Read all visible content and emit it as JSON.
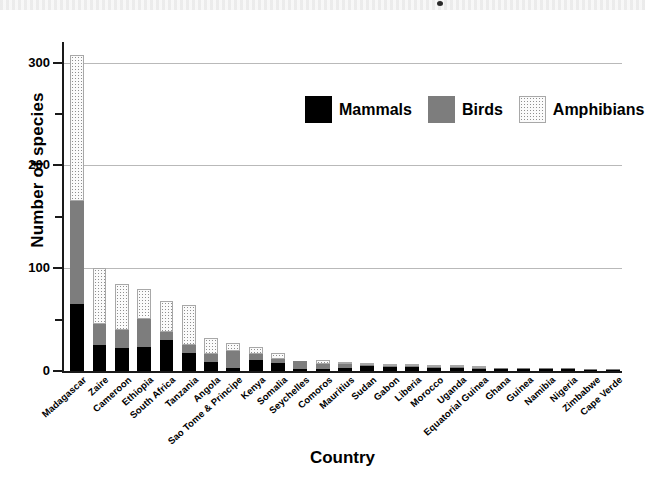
{
  "chart_data": {
    "type": "bar",
    "subtype": "stacked-bar",
    "title": "",
    "xlabel": "Country",
    "ylabel": "Number of species",
    "ylim": [
      0,
      320
    ],
    "ytick_labels": [
      "0",
      "100",
      "200",
      "300"
    ],
    "ytick_values": [
      0,
      100,
      200,
      300
    ],
    "yminor_ticks": [
      50,
      150,
      250
    ],
    "grid": "horizontal-major",
    "legend_position": "upper-center",
    "categories": [
      "Madagascar",
      "Zaire",
      "Cameroon",
      "Ethiopia",
      "South Africa",
      "Tanzania",
      "Angola",
      "Sao Tome & Principe",
      "Kenya",
      "Somalia",
      "Seychelles",
      "Comoros",
      "Mauritius",
      "Sudan",
      "Gabon",
      "Liberia",
      "Morocco",
      "Uganda",
      "Equatorial Guinea",
      "Ghana",
      "Guinea",
      "Namibia",
      "Nigeria",
      "Zimbabwe",
      "Cape Verde"
    ],
    "series": [
      {
        "name": "Mammals",
        "color": "#000000",
        "values": [
          65,
          25,
          22,
          23,
          30,
          18,
          9,
          3,
          11,
          8,
          2,
          2,
          3,
          5,
          4,
          4,
          3,
          3,
          2,
          2,
          2,
          2,
          2,
          1,
          1
        ]
      },
      {
        "name": "Birds",
        "color": "#7d7d7d",
        "values": [
          100,
          21,
          18,
          28,
          8,
          7,
          8,
          16,
          6,
          4,
          8,
          5,
          4,
          1,
          1,
          1,
          1,
          1,
          1,
          1,
          1,
          1,
          1,
          1,
          1
        ]
      },
      {
        "name": "Amphibians",
        "color": "#f2f2f2",
        "values": [
          142,
          54,
          45,
          29,
          30,
          39,
          15,
          8,
          6,
          6,
          0,
          4,
          1,
          2,
          2,
          1,
          2,
          1,
          1,
          0,
          0,
          0,
          0,
          0,
          0
        ]
      }
    ],
    "totals": [
      307,
      100,
      85,
      80,
      68,
      64,
      32,
      27,
      23,
      18,
      10,
      11,
      8,
      8,
      7,
      6,
      6,
      5,
      4,
      3,
      3,
      3,
      3,
      2,
      2
    ]
  },
  "legend": {
    "items": [
      {
        "label": "Mammals",
        "swatch": "mammals-swatch"
      },
      {
        "label": "Birds",
        "swatch": "birds-swatch"
      },
      {
        "label": "Amphibians",
        "swatch": "amphibians-swatch"
      }
    ]
  },
  "axes": {
    "y_title": "Number of species",
    "x_title": "Country"
  }
}
